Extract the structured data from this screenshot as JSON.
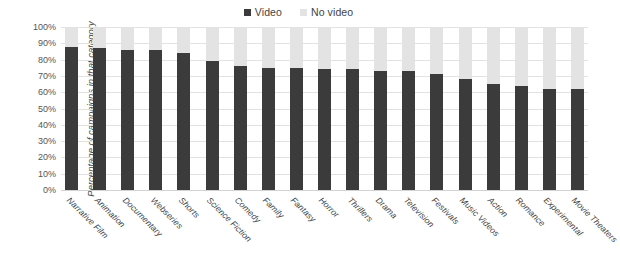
{
  "chart_data": {
    "type": "bar",
    "stacked": true,
    "title": "",
    "xlabel": "",
    "ylabel": "Percentage of campaigns in that category",
    "ylim": [
      0,
      100
    ],
    "y_tick_labels": [
      "100%",
      "90%",
      "80%",
      "70%",
      "60%",
      "50%",
      "40%",
      "30%",
      "20%",
      "10%",
      "0%"
    ],
    "y_tick_values": [
      100,
      90,
      80,
      70,
      60,
      50,
      40,
      30,
      20,
      10,
      0
    ],
    "grid": true,
    "legend_position": "top-center",
    "categories": [
      "Narrative Film",
      "Animation",
      "Documentary",
      "Webseries",
      "Shorts",
      "Science Fiction",
      "Comedy",
      "Family",
      "Fantasy",
      "Horror",
      "Thrillers",
      "Drama",
      "Television",
      "Festivals",
      "Music Videos",
      "Action",
      "Romance",
      "Experimental",
      "Movie Theaters"
    ],
    "series": [
      {
        "name": "Video",
        "color": "#3b3b3b",
        "values": [
          88,
          87,
          86,
          86,
          84,
          79,
          76,
          75,
          75,
          74,
          74,
          73,
          73,
          71,
          68,
          65,
          64,
          62,
          62
        ]
      },
      {
        "name": "No video",
        "color": "#e3e3e3",
        "values": [
          12,
          13,
          14,
          14,
          16,
          21,
          24,
          25,
          25,
          26,
          26,
          27,
          27,
          29,
          32,
          35,
          36,
          38,
          38
        ]
      }
    ]
  },
  "legend": {
    "items": [
      {
        "label": "Video",
        "color": "#3b3b3b"
      },
      {
        "label": "No video",
        "color": "#e3e3e3"
      }
    ]
  },
  "colors": {
    "video": "#3b3b3b",
    "no_video": "#e3e3e3",
    "gridline": "#e2e2e2",
    "background": "#ffffff"
  }
}
